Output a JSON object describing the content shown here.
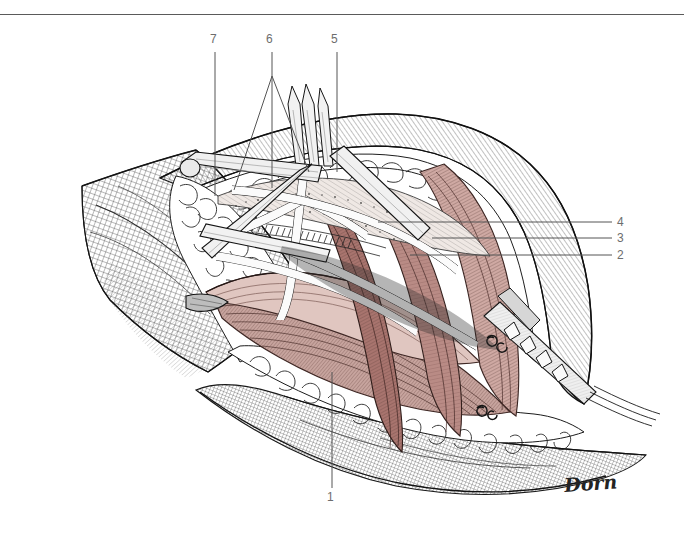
{
  "page": {
    "width": 684,
    "height": 539,
    "background": "#ffffff",
    "rule_color": "#5a5a5a"
  },
  "figure": {
    "kind": "surgical-anatomy-illustration",
    "technique": "pen-and-ink line drawing with watercolor wash",
    "signature": "Dorn",
    "palette": {
      "ink": "#1a1a1a",
      "hatch": "#4a4a4a",
      "muscle_dark": "#7d5450",
      "muscle_mid": "#a8746e",
      "muscle_light": "#c9a39c",
      "muscle_pale": "#e3cac5",
      "fat_fill": "#ffffff",
      "fat_outline": "#2b2b2b",
      "skin_wash": "#d8d2cc",
      "metal": "#e8e8e8",
      "metal_shadow": "#9a9a9a",
      "label_text": "#6d6d6d",
      "leader_line": "#555555"
    }
  },
  "labels": [
    {
      "id": "1",
      "text": "1",
      "position": "bottom-center",
      "leader": "vertical line rising from number up into the muscle belly"
    },
    {
      "id": "2",
      "text": "2",
      "position": "right",
      "leader": "horizontal line running left into the deep muscle/vessel layer"
    },
    {
      "id": "3",
      "text": "3",
      "position": "right",
      "leader": "horizontal line running left to the fascial edge"
    },
    {
      "id": "4",
      "text": "4",
      "position": "right",
      "leader": "horizontal line running left to the superficial muscle"
    },
    {
      "id": "5",
      "text": "5",
      "position": "top",
      "leader": "vertical line descending to the retractor blade region"
    },
    {
      "id": "6",
      "text": "6",
      "position": "top",
      "leader": "vertical line that branches into two oblique lines pointing to paired structures"
    },
    {
      "id": "7",
      "text": "7",
      "position": "top",
      "leader": "vertical line descending into the upper dissection field"
    }
  ],
  "leader_lines": [
    {
      "for": "7",
      "points": "215,55 215,196"
    },
    {
      "for": "6",
      "points": "272,55 272,188"
    },
    {
      "for": "6b",
      "points": "272,75 233,188"
    },
    {
      "for": "6c",
      "points": "272,75 307,170"
    },
    {
      "for": "5",
      "points": "337,55 337,170"
    },
    {
      "for": "4",
      "points": "612,222 378,222"
    },
    {
      "for": "3",
      "points": "612,238 430,238"
    },
    {
      "for": "2",
      "points": "612,255 408,255"
    },
    {
      "for": "1",
      "points": "332,489 332,372"
    }
  ]
}
